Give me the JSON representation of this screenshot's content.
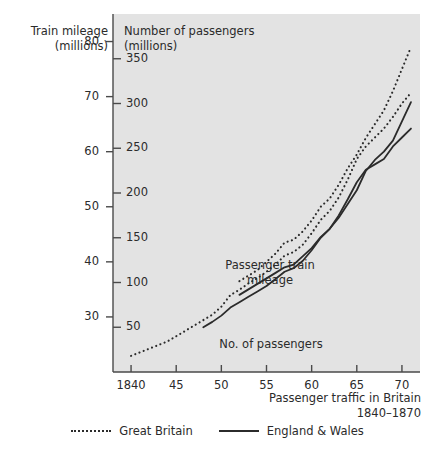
{
  "chart_data": {
    "type": "line",
    "title": "",
    "caption": {
      "line1": "Passenger traffic in Britain",
      "line2": "1840–1870"
    },
    "left_axis": {
      "label_line1": "Train mileage",
      "label_line2": "(millions)",
      "ticks": [
        80,
        70,
        60,
        50,
        40,
        30
      ],
      "tick_labels": [
        "80",
        "70",
        "60",
        "50",
        "40",
        "30"
      ],
      "range": [
        20,
        85
      ],
      "units": "millions of train miles"
    },
    "right_axis": {
      "label_line1": "Number of passengers",
      "label_line2": "(millions)",
      "ticks": [
        350,
        300,
        250,
        200,
        150,
        100,
        50
      ],
      "tick_labels": [
        "350",
        "300",
        "250",
        "200",
        "150",
        "100",
        "50"
      ],
      "range": [
        0,
        400
      ],
      "units": "millions of passengers"
    },
    "xaxis": {
      "label": "",
      "ticks": [
        1840,
        1845,
        1850,
        1855,
        1860,
        1865,
        1870
      ],
      "tick_labels": [
        "1840",
        "45",
        "50",
        "55",
        "60",
        "65",
        "70"
      ],
      "range": [
        1838,
        1872
      ]
    },
    "grid": false,
    "legend_position": "bottom-center",
    "annotations": [
      {
        "text_line1": "Passenger train",
        "text_line2": "mileage",
        "x": 1856.2,
        "y_axis": "left"
      },
      {
        "text_line1": "No. of passengers",
        "text_line2": "",
        "x": 1856.5,
        "y_axis": "right"
      }
    ],
    "series": [
      {
        "name": "Great Britain",
        "measure": "Passenger train mileage",
        "axis": "left",
        "style": "dotted",
        "color": "#2b2b2b",
        "x": [
          1852,
          1853,
          1854,
          1855,
          1856,
          1857,
          1858,
          1859,
          1860,
          1861,
          1862,
          1863,
          1864,
          1865,
          1866,
          1867,
          1868,
          1869,
          1870,
          1871
        ],
        "values": [
          36.5,
          37.5,
          38.5,
          40.0,
          41.5,
          43.5,
          44.0,
          45.5,
          47.5,
          50.0,
          51.5,
          54.0,
          57.0,
          59.5,
          62.5,
          65.0,
          67.5,
          71.0,
          75.0,
          79.0
        ]
      },
      {
        "name": "England & Wales",
        "measure": "Passenger train mileage",
        "axis": "left",
        "style": "solid",
        "color": "#2b2b2b",
        "x": [
          1852,
          1853,
          1854,
          1855,
          1856,
          1857,
          1858,
          1859,
          1860,
          1861,
          1862,
          1863,
          1864,
          1865,
          1866,
          1867,
          1868,
          1869,
          1870,
          1871
        ],
        "values": [
          34.0,
          35.0,
          36.0,
          37.0,
          38.0,
          39.0,
          39.5,
          41.0,
          42.5,
          44.5,
          46.0,
          48.0,
          50.5,
          53.0,
          56.5,
          58.5,
          60.0,
          62.0,
          65.5,
          69.0
        ]
      },
      {
        "name": "Great Britain",
        "measure": "Number of passengers",
        "axis": "right",
        "style": "dotted",
        "color": "#2b2b2b",
        "x": [
          1840,
          1841,
          1842,
          1843,
          1844,
          1845,
          1846,
          1847,
          1848,
          1849,
          1850,
          1851,
          1852,
          1853,
          1854,
          1855,
          1856,
          1857,
          1858,
          1859,
          1860,
          1861,
          1862,
          1863,
          1864,
          1865,
          1866,
          1867,
          1868,
          1869,
          1870,
          1871
        ],
        "values": [
          18,
          22,
          26,
          30,
          34,
          40,
          46,
          52,
          58,
          64,
          73,
          86,
          92,
          99,
          105,
          112,
          120,
          130,
          134,
          142,
          155,
          170,
          180,
          195,
          215,
          238,
          252,
          262,
          272,
          285,
          300,
          312
        ]
      },
      {
        "name": "England & Wales",
        "measure": "Number of passengers",
        "axis": "right",
        "style": "solid",
        "color": "#2b2b2b",
        "x": [
          1848,
          1849,
          1850,
          1851,
          1852,
          1853,
          1854,
          1855,
          1856,
          1857,
          1858,
          1859,
          1860,
          1861,
          1862,
          1863,
          1864,
          1865,
          1866,
          1867,
          1868,
          1869,
          1870,
          1871
        ],
        "values": [
          50,
          56,
          63,
          72,
          78,
          84,
          90,
          96,
          104,
          112,
          116,
          124,
          136,
          150,
          160,
          175,
          193,
          212,
          226,
          232,
          238,
          252,
          262,
          272
        ]
      }
    ],
    "legend": [
      {
        "label": "Great Britain",
        "style": "dotted"
      },
      {
        "label": "England & Wales",
        "style": "solid"
      }
    ],
    "plot_background": "#e3e3e3",
    "axis_color": "#4a4a4a",
    "line_color": "#2b2b2b"
  }
}
